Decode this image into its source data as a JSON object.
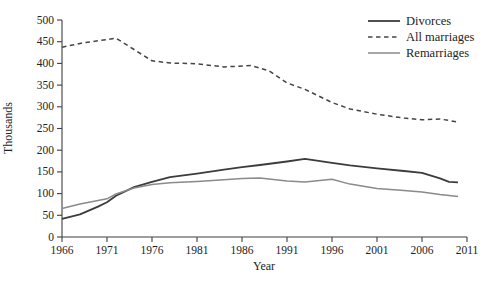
{
  "chart_data": {
    "type": "line",
    "title": "",
    "xlabel": "Year",
    "ylabel": "Thousands",
    "xlim": [
      1966,
      2011
    ],
    "ylim": [
      0,
      500
    ],
    "xticks": [
      1966,
      1971,
      1976,
      1981,
      1986,
      1991,
      1996,
      2001,
      2006,
      2011
    ],
    "yticks": [
      0,
      50,
      100,
      150,
      200,
      250,
      300,
      350,
      400,
      450,
      500
    ],
    "grid": false,
    "legend_position": "top-right",
    "axis_color": "#3f3f3f",
    "text_color": "#232323",
    "series": [
      {
        "name": "Divorces",
        "style": "solid",
        "color": "#3c3c3c",
        "width": 1.8,
        "x": [
          1966,
          1968,
          1970,
          1971,
          1972,
          1974,
          1976,
          1978,
          1981,
          1984,
          1986,
          1988,
          1991,
          1993,
          1996,
          1998,
          2001,
          2004,
          2006,
          2008,
          2009,
          2010
        ],
        "y": [
          42,
          52,
          70,
          80,
          95,
          115,
          127,
          138,
          146,
          155,
          161,
          166,
          174,
          180,
          171,
          165,
          158,
          152,
          148,
          135,
          127,
          126
        ]
      },
      {
        "name": "All marriages",
        "style": "dashed",
        "color": "#454545",
        "width": 1.5,
        "x": [
          1966,
          1968,
          1970,
          1972,
          1974,
          1976,
          1978,
          1981,
          1984,
          1987,
          1989,
          1991,
          1993,
          1996,
          1998,
          2001,
          2004,
          2006,
          2008,
          2010
        ],
        "y": [
          437,
          446,
          452,
          458,
          432,
          406,
          401,
          399,
          392,
          395,
          383,
          355,
          340,
          310,
          295,
          283,
          274,
          270,
          272,
          265
        ]
      },
      {
        "name": "Remarriages",
        "style": "solid",
        "color": "#8a8a8a",
        "width": 1.5,
        "x": [
          1966,
          1968,
          1971,
          1972,
          1974,
          1976,
          1978,
          1981,
          1984,
          1986,
          1988,
          1991,
          1993,
          1996,
          1998,
          2001,
          2004,
          2006,
          2008,
          2010
        ],
        "y": [
          66,
          76,
          88,
          99,
          113,
          121,
          125,
          128,
          132,
          135,
          136,
          129,
          127,
          133,
          122,
          112,
          107,
          104,
          98,
          93
        ]
      }
    ]
  }
}
